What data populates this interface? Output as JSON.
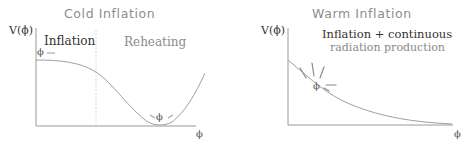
{
  "panels": [
    {
      "title": "Cold Inflation",
      "y_axis_label": "V(ϕ)",
      "x_axis_label": "ϕ",
      "regions": [
        "Inflation",
        "Reheating"
      ],
      "field_labels": [
        "ϕ",
        "ϕ"
      ],
      "description": "Potential starts flat (inflation), falls and oscillates around minimum (reheating)"
    },
    {
      "title": "Warm Inflation",
      "y_axis_label": "V(ϕ)",
      "x_axis_label": "ϕ",
      "annotation_line1": "Inflation + continuous",
      "annotation_line2": "radiation production",
      "field_label": "ϕ",
      "description": "Monotonically decreasing potential with field radiating while rolling"
    }
  ],
  "colors": {
    "curve": "#a0a0a0",
    "axis": "#9a9a9a",
    "text_dark": "#333333",
    "text_light": "#8a8a8a"
  }
}
